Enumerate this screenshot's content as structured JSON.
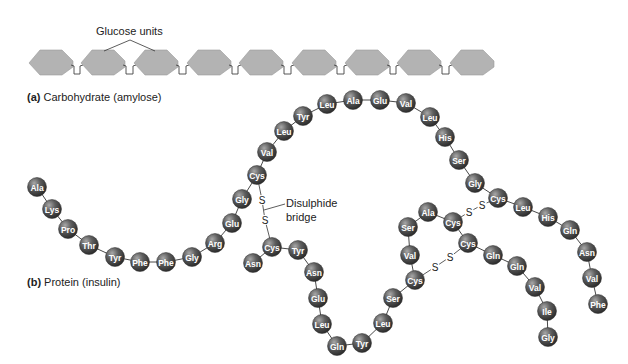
{
  "figure": {
    "background": "#ffffff",
    "bead_color": "#5a5a5a",
    "bead_highlight": "#9a9a9a",
    "hexagon_fill": "#b3b3b3",
    "hexagon_stroke": "#9a9a9a"
  },
  "panel_a": {
    "letter": "(a)",
    "title": "Carbohydrate (amylose)",
    "annotation": "Glucose units",
    "unit_count": 9,
    "hexagons_x": [
      29,
      81,
      134,
      187,
      239,
      292,
      345,
      397,
      450
    ]
  },
  "panel_b": {
    "letter": "(b)",
    "title": "Protein (insulin)",
    "annotation_line1": "Disulphide",
    "annotation_line2": "bridge",
    "sulfur_label": "S",
    "chain_b": [
      {
        "aa": "Ala",
        "x": 37,
        "y": 187
      },
      {
        "aa": "Lys",
        "x": 52,
        "y": 209
      },
      {
        "aa": "Pro",
        "x": 68,
        "y": 229
      },
      {
        "aa": "Thr",
        "x": 89,
        "y": 245
      },
      {
        "aa": "Tyr",
        "x": 115,
        "y": 257
      },
      {
        "aa": "Phe",
        "x": 140,
        "y": 262
      },
      {
        "aa": "Phe",
        "x": 166,
        "y": 262
      },
      {
        "aa": "Gly",
        "x": 192,
        "y": 257
      },
      {
        "aa": "Arg",
        "x": 215,
        "y": 243
      },
      {
        "aa": "Glu",
        "x": 232,
        "y": 223
      },
      {
        "aa": "Gly",
        "x": 242,
        "y": 199
      },
      {
        "aa": "Cys",
        "x": 257,
        "y": 175
      },
      {
        "aa": "Val",
        "x": 267,
        "y": 152
      },
      {
        "aa": "Leu",
        "x": 284,
        "y": 131
      },
      {
        "aa": "Tyr",
        "x": 303,
        "y": 116
      },
      {
        "aa": "Leu",
        "x": 327,
        "y": 104
      },
      {
        "aa": "Ala",
        "x": 353,
        "y": 100
      },
      {
        "aa": "Glu",
        "x": 380,
        "y": 100
      },
      {
        "aa": "Val",
        "x": 406,
        "y": 103
      },
      {
        "aa": "Leu",
        "x": 430,
        "y": 117
      },
      {
        "aa": "His",
        "x": 445,
        "y": 137
      },
      {
        "aa": "Ser",
        "x": 459,
        "y": 160
      },
      {
        "aa": "Gly",
        "x": 475,
        "y": 183
      },
      {
        "aa": "Cys",
        "x": 498,
        "y": 198
      },
      {
        "aa": "Leu",
        "x": 523,
        "y": 207
      },
      {
        "aa": "His",
        "x": 548,
        "y": 217
      },
      {
        "aa": "Gln",
        "x": 570,
        "y": 230
      },
      {
        "aa": "Asn",
        "x": 587,
        "y": 252
      },
      {
        "aa": "Val",
        "x": 592,
        "y": 278
      },
      {
        "aa": "Phe",
        "x": 598,
        "y": 304
      }
    ],
    "chain_a": [
      {
        "aa": "Asn",
        "x": 253,
        "y": 263
      },
      {
        "aa": "Cys",
        "x": 272,
        "y": 247
      },
      {
        "aa": "Tyr",
        "x": 298,
        "y": 250
      },
      {
        "aa": "Asn",
        "x": 314,
        "y": 272
      },
      {
        "aa": "Glu",
        "x": 318,
        "y": 298
      },
      {
        "aa": "Leu",
        "x": 322,
        "y": 324
      },
      {
        "aa": "Gln",
        "x": 337,
        "y": 346
      },
      {
        "aa": "Tyr",
        "x": 362,
        "y": 343
      },
      {
        "aa": "Leu",
        "x": 383,
        "y": 323
      },
      {
        "aa": "Ser",
        "x": 393,
        "y": 298
      },
      {
        "aa": "Cys",
        "x": 415,
        "y": 280
      },
      {
        "aa": "Val",
        "x": 410,
        "y": 255
      },
      {
        "aa": "Ser",
        "x": 408,
        "y": 227
      },
      {
        "aa": "Ala",
        "x": 428,
        "y": 212
      },
      {
        "aa": "Cys",
        "x": 453,
        "y": 222
      },
      {
        "aa": "Cys",
        "x": 468,
        "y": 243
      },
      {
        "aa": "Gln",
        "x": 493,
        "y": 255
      },
      {
        "aa": "Gln",
        "x": 517,
        "y": 266
      },
      {
        "aa": "Val",
        "x": 535,
        "y": 287
      },
      {
        "aa": "Ile",
        "x": 547,
        "y": 311
      },
      {
        "aa": "Gly",
        "x": 548,
        "y": 337
      }
    ],
    "disulphide_bridges": [
      {
        "from": [
          257,
          175
        ],
        "s1": [
          262,
          200
        ],
        "s2": [
          265,
          220
        ],
        "to": [
          272,
          247
        ]
      },
      {
        "from": [
          453,
          222
        ],
        "s1": [
          469,
          212
        ],
        "s2": [
          482,
          205
        ],
        "to": [
          498,
          198
        ]
      },
      {
        "from": [
          468,
          243
        ],
        "s1": [
          450,
          257
        ],
        "s2": [
          435,
          267
        ],
        "to": [
          415,
          280
        ]
      }
    ]
  }
}
